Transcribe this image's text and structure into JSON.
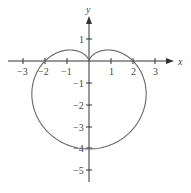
{
  "chart_data": {
    "type": "line",
    "title": "",
    "equation": "r = 2 - 2 sin θ",
    "xlabel": "x",
    "ylabel": "y",
    "xlim": [
      -3.5,
      4
    ],
    "ylim": [
      -5.5,
      2
    ],
    "x_ticks": [
      -3,
      -2,
      -1,
      1,
      2,
      3
    ],
    "y_ticks": [
      1,
      -1,
      -2,
      -3,
      -4,
      -5
    ],
    "x_tick_labels": [
      "−3",
      "−2",
      "−1",
      "1",
      "2",
      "3"
    ],
    "y_tick_labels": [
      "1",
      "−1",
      "−2",
      "−3",
      "−4",
      "−5"
    ],
    "grid": false,
    "series": [
      {
        "name": "cardioid",
        "key_points": [
          [
            0,
            0
          ],
          [
            2,
            0
          ],
          [
            0,
            -4
          ],
          [
            -2,
            0
          ],
          [
            0.77,
            0.77
          ],
          [
            -0.77,
            0.77
          ]
        ]
      }
    ]
  },
  "colors": {
    "axis": "#333333",
    "curve": "#666666",
    "text": "#444444"
  }
}
